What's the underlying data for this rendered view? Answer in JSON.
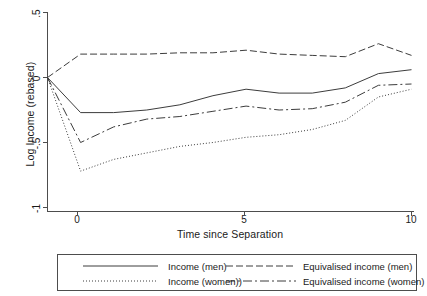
{
  "chart_data": {
    "type": "line",
    "title": "",
    "subtitle": "",
    "xlabel": "Time since Separation",
    "ylabel": "Log Income (rebased)",
    "xlim": [
      -1,
      10
    ],
    "ylim": [
      -1,
      0.5
    ],
    "xticks": [
      0,
      5,
      10
    ],
    "xtick_labels": [
      "0",
      "5",
      "10"
    ],
    "yticks": [
      0.5,
      0,
      -0.5,
      -1
    ],
    "ytick_labels": [
      ".5",
      "0",
      "-.5",
      "-1"
    ],
    "grid": false,
    "legend_position": "below",
    "x": [
      -1,
      0,
      1,
      2,
      3,
      4,
      5,
      6,
      7,
      8,
      9,
      10
    ],
    "series": [
      {
        "name": "Income (men)",
        "style": "solid",
        "color": "#3c3c3c",
        "values": [
          0,
          -0.27,
          -0.27,
          -0.25,
          -0.21,
          -0.14,
          -0.09,
          -0.12,
          -0.12,
          -0.08,
          0.03,
          0.06
        ]
      },
      {
        "name": "Income (women))",
        "style": "dotted",
        "color": "#3c3c3c",
        "values": [
          0,
          -0.72,
          -0.63,
          -0.58,
          -0.53,
          -0.5,
          -0.46,
          -0.44,
          -0.4,
          -0.33,
          -0.15,
          -0.09
        ]
      },
      {
        "name": "Equivalised income (men)",
        "style": "dashed",
        "color": "#3c3c3c",
        "values": [
          0,
          0.18,
          0.18,
          0.18,
          0.19,
          0.19,
          0.21,
          0.18,
          0.17,
          0.16,
          0.26,
          0.17
        ]
      },
      {
        "name": "Equivalised income (women)",
        "style": "dashdot",
        "color": "#3c3c3c",
        "values": [
          0,
          -0.5,
          -0.38,
          -0.32,
          -0.3,
          -0.26,
          -0.22,
          -0.25,
          -0.24,
          -0.19,
          -0.06,
          -0.05
        ]
      }
    ]
  },
  "axes": {
    "ylabel": "Log Income (rebased)",
    "xlabel": "Time since Separation",
    "ytick_labels": [
      ".5",
      "0",
      "-.5",
      "-1"
    ],
    "xtick_labels": [
      "0",
      "5",
      "10"
    ]
  },
  "legend": {
    "items": [
      {
        "label": "Income (men)",
        "style": "solid"
      },
      {
        "label": "Equivalised income (men)",
        "style": "dashed"
      },
      {
        "label": "Income (women))",
        "style": "dotted"
      },
      {
        "label": "Equivalised income (women)",
        "style": "dashdot"
      }
    ]
  },
  "colors": {
    "line": "#3c3c3c",
    "axis": "#4d4d4d",
    "text": "#1a1a1a",
    "background": "#ffffff"
  }
}
